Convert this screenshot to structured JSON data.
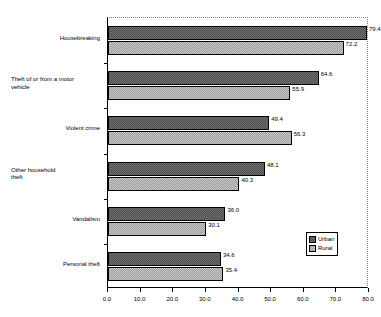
{
  "chart_data": {
    "type": "bar",
    "orientation": "horizontal",
    "title": "",
    "subtitle": "",
    "xlabel": "",
    "ylabel": "",
    "xlim": [
      0.0,
      80.0
    ],
    "xticks": [
      "0.0",
      "10.0",
      "20.0",
      "30.0",
      "40.0",
      "50.0",
      "60.0",
      "70.0",
      "80.0"
    ],
    "xtick_values": [
      0,
      10,
      20,
      30,
      40,
      50,
      60,
      70,
      80
    ],
    "grid": false,
    "legend_position": "bottom-right-inside",
    "categories": [
      "Housebreaking",
      "Theft of or from a motor vehicle",
      "Violent crime",
      "Other household theft",
      "Vandalism",
      "Personal theft"
    ],
    "category_lines": [
      [
        "Housebreaking"
      ],
      [
        "Theft of or from a motor",
        "vehicle"
      ],
      [
        "Violent crime"
      ],
      [
        "Other household",
        "theft"
      ],
      [
        "Vandalism"
      ],
      [
        "Personal theft"
      ]
    ],
    "series": [
      {
        "name": "Urban",
        "color": "#4b4b4b",
        "values": [
          79.4,
          64.6,
          49.4,
          48.1,
          36.0,
          34.6
        ],
        "labels": [
          "79.4",
          "64.6",
          "49.4",
          "48.1",
          "36.0",
          "34.6"
        ]
      },
      {
        "name": "Rural",
        "color": "#9d9d9d",
        "values": [
          72.2,
          55.9,
          56.3,
          40.3,
          30.1,
          35.4
        ],
        "labels": [
          "72.2",
          "55.9",
          "56.3",
          "40.3",
          "30.1",
          "35.4"
        ]
      }
    ]
  },
  "legend": {
    "entries": [
      {
        "label": "Urban"
      },
      {
        "label": "Rural"
      }
    ]
  },
  "colors": {
    "urban": "#4b4b4b",
    "rural": "#9d9d9d",
    "axis": "#000000",
    "border": "#808080",
    "background": "#ffffff"
  }
}
